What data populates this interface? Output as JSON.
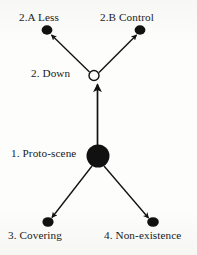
{
  "diagram": {
    "background_color": "#fbfbf9",
    "ink_color": "#111111",
    "nodes": [
      {
        "id": "proto-scene",
        "label": "1. Proto-scene",
        "shape": "filled-circle",
        "size": "large",
        "x": 98,
        "y": 156,
        "radius": 11
      },
      {
        "id": "down",
        "label": "2. Down",
        "shape": "open-circle",
        "size": "small",
        "x": 94,
        "y": 76,
        "radius": 5
      },
      {
        "id": "less",
        "label": "2.A Less",
        "shape": "filled-circle",
        "size": "small",
        "x": 47,
        "y": 30,
        "radius": 5
      },
      {
        "id": "control",
        "label": "2.B Control",
        "shape": "filled-circle",
        "size": "small",
        "x": 140,
        "y": 30,
        "radius": 5
      },
      {
        "id": "covering",
        "label": "3. Covering",
        "shape": "filled-circle",
        "size": "small",
        "x": 48,
        "y": 222,
        "radius": 5
      },
      {
        "id": "non-existence",
        "label": "4. Non-existence",
        "shape": "filled-circle",
        "size": "small",
        "x": 153,
        "y": 222,
        "radius": 5
      }
    ],
    "edges": [
      {
        "id": "proto-to-down",
        "from": "proto-scene",
        "to": "down",
        "arrow": "end",
        "direction": "up"
      },
      {
        "id": "down-to-less",
        "from": "down",
        "to": "less",
        "arrow": "end",
        "direction": "up-left"
      },
      {
        "id": "down-to-control",
        "from": "down",
        "to": "control",
        "arrow": "end",
        "direction": "up-right"
      },
      {
        "id": "proto-to-covering",
        "from": "proto-scene",
        "to": "covering",
        "arrow": "end",
        "direction": "down-left"
      },
      {
        "id": "proto-to-non",
        "from": "proto-scene",
        "to": "non-existence",
        "arrow": "end",
        "direction": "down-right"
      }
    ]
  }
}
